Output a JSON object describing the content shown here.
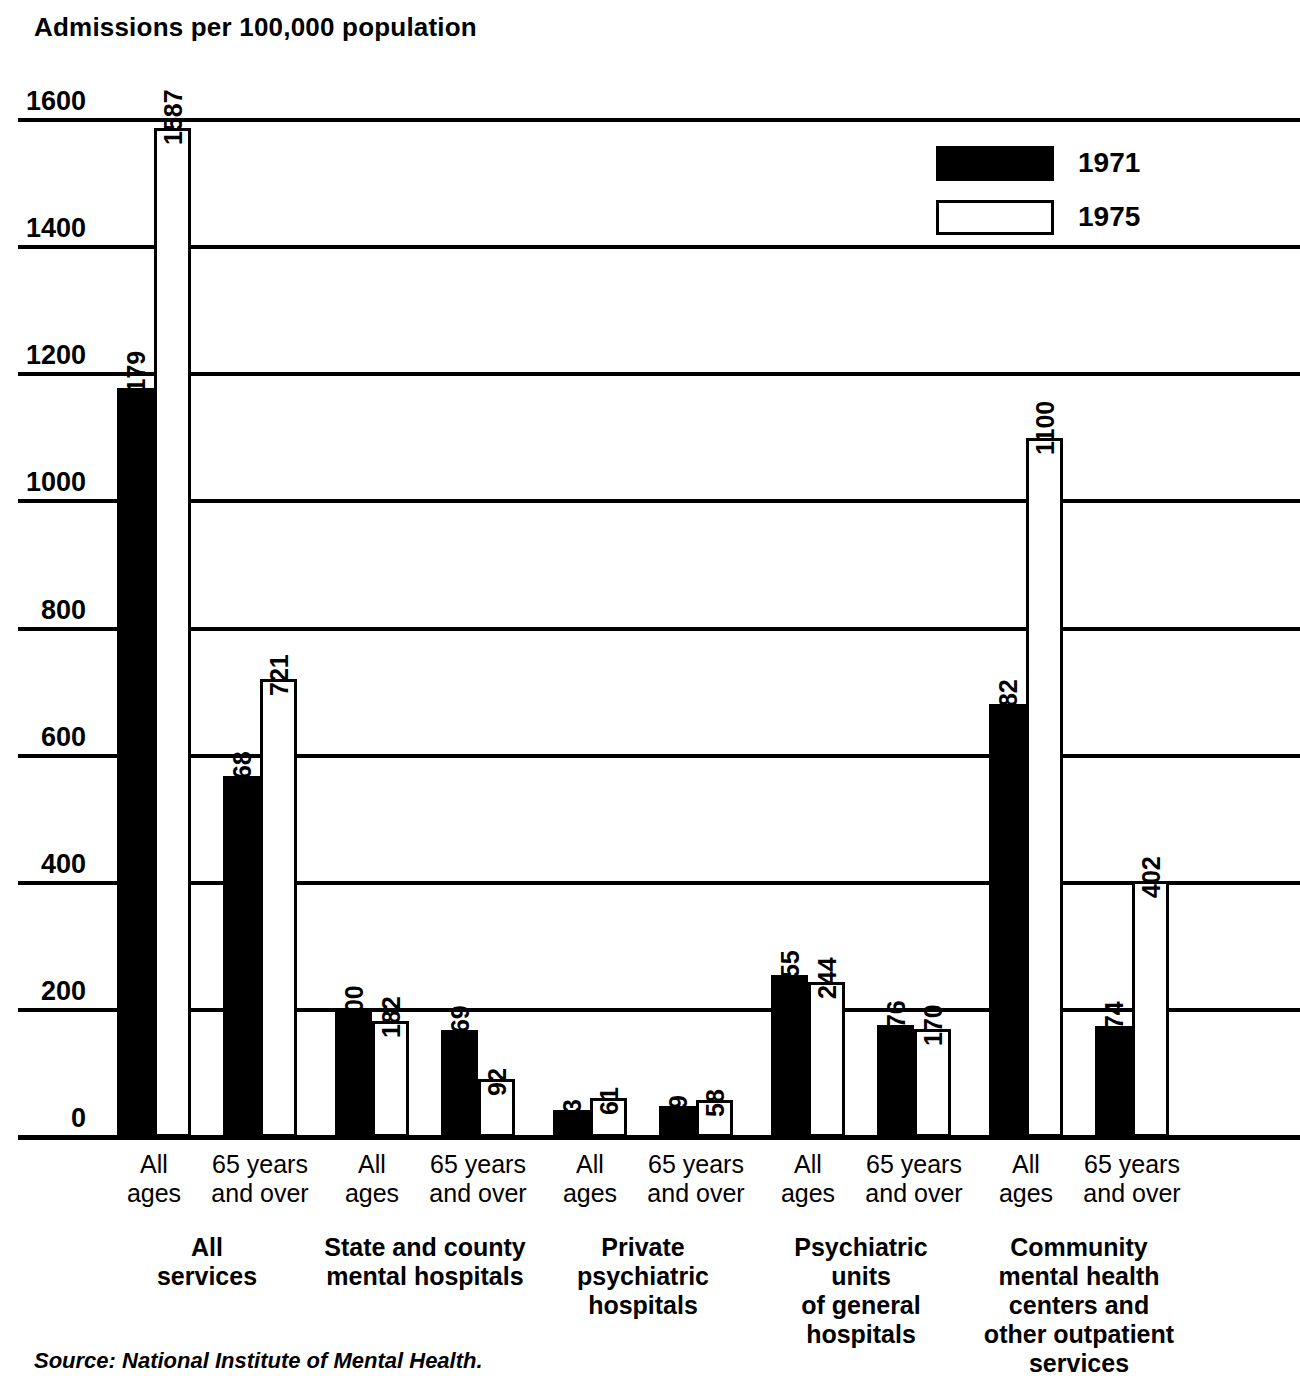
{
  "chart_data": {
    "type": "bar",
    "title": "Admissions per 100,000 population",
    "xlabel": "",
    "ylabel": "Admissions per 100,000 population",
    "ylim": [
      0,
      1600
    ],
    "ytick_labels": [
      "0",
      "200",
      "400",
      "600",
      "800",
      "1000",
      "1200",
      "1400",
      "1600"
    ],
    "ytick_values": [
      0,
      200,
      400,
      600,
      800,
      1000,
      1200,
      1400,
      1600
    ],
    "grid": true,
    "legend_position": "top-right",
    "legend": [
      "1971",
      "1975"
    ],
    "series": [
      {
        "name": "1971",
        "color": "#000000",
        "values": [
          1179,
          568,
          200,
          169,
          43,
          49,
          255,
          176,
          682,
          174
        ]
      },
      {
        "name": "1975",
        "color": "#ffffff",
        "values": [
          1587,
          721,
          182,
          92,
          61,
          58,
          244,
          170,
          1100,
          402
        ]
      }
    ],
    "categories": [
      "All\nages",
      "65 years\nand over",
      "All\nages",
      "65 years\nand over",
      "All\nages",
      "65 years\nand over",
      "All\nages",
      "65 years\nand over",
      "All\nages",
      "65 years\nand over"
    ],
    "groups": [
      {
        "label": "All\nservices",
        "span": 2
      },
      {
        "label": "State and county\nmental hospitals",
        "span": 2
      },
      {
        "label": "Private\npsychiatric\nhospitals",
        "span": 2
      },
      {
        "label": "Psychiatric\nunits\nof general\nhospitals",
        "span": 2
      },
      {
        "label": "Community\nmental health\ncenters and\nother outpatient\nservices",
        "span": 2
      }
    ],
    "source": "Source: National Institute of Mental Health."
  },
  "axis": {
    "title": "Admissions per 100,000 population"
  },
  "footer": {
    "source": "Source: National Institute of Mental Health."
  }
}
